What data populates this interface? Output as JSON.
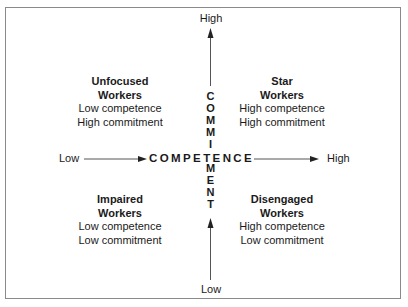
{
  "diagram": {
    "vertical_axis": {
      "label": "COMMITMENT",
      "letters": [
        "C",
        "O",
        "M",
        "M",
        "I",
        "T",
        "M",
        "E",
        "N",
        "T"
      ],
      "high_label": "High",
      "low_label": "Low"
    },
    "horizontal_axis": {
      "label": "COMPETENCE",
      "low_label": "Low",
      "high_label": "High"
    },
    "quadrants": {
      "top_left": {
        "title_line1": "Unfocused",
        "title_line2": "Workers",
        "desc_line1": "Low competence",
        "desc_line2": "High commitment"
      },
      "top_right": {
        "title_line1": "Star",
        "title_line2": "Workers",
        "desc_line1": "High competence",
        "desc_line2": "High commitment"
      },
      "bottom_left": {
        "title_line1": "Impaired",
        "title_line2": "Workers",
        "desc_line1": "Low competence",
        "desc_line2": "Low commitment"
      },
      "bottom_right": {
        "title_line1": "Disengaged",
        "title_line2": "Workers",
        "desc_line1": "High competence",
        "desc_line2": "Low commitment"
      }
    },
    "colors": {
      "border": "#8a8a8a",
      "text": "#1a1a1a",
      "arrows": "#333333"
    }
  }
}
